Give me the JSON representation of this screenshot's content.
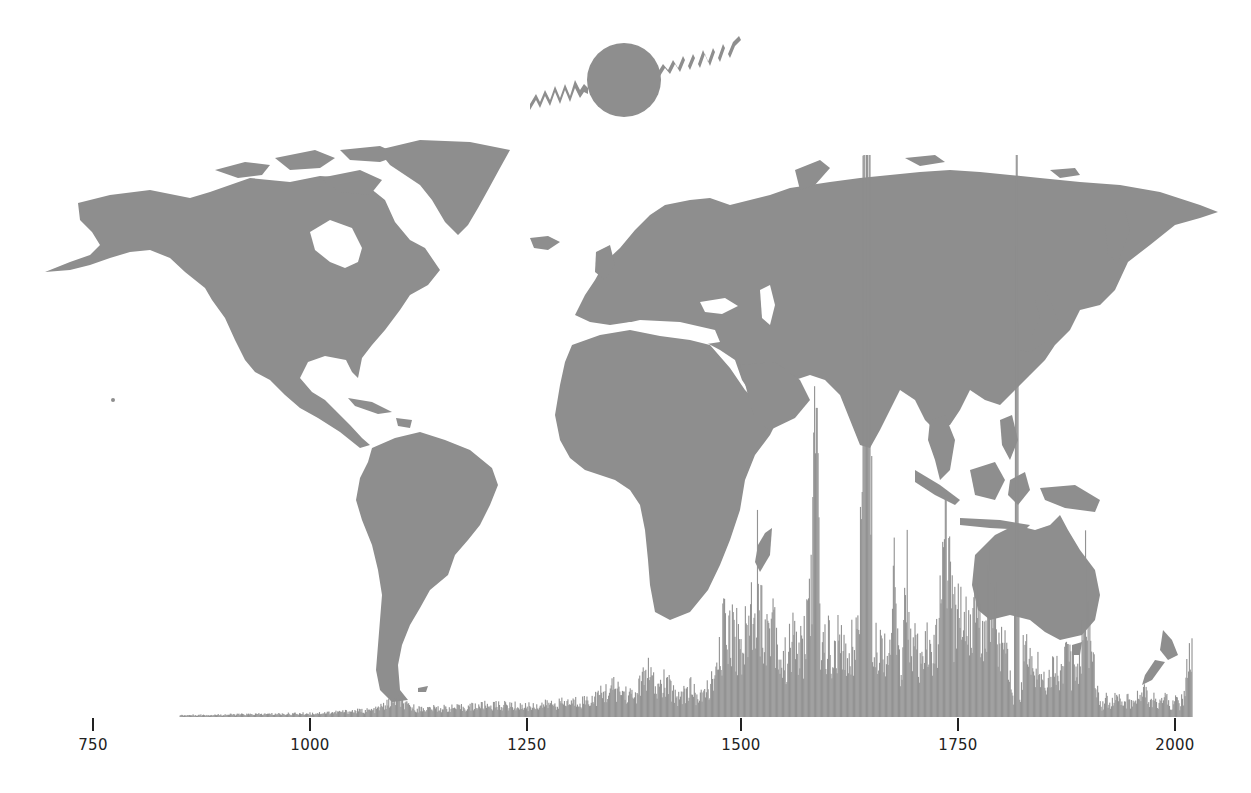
{
  "chart_data": {
    "type": "area",
    "title": "",
    "subtitle": "",
    "xlabel": "",
    "ylabel": "",
    "xlim": [
      750,
      2015
    ],
    "x_ticks": [
      750,
      1000,
      1250,
      1500,
      1750,
      2000
    ],
    "tick_labels": [
      "750",
      "1000",
      "1250",
      "1500",
      "1750",
      "2000"
    ],
    "grid": false,
    "legend": null,
    "series_color": "#8e8e8e",
    "ylim_relative": [
      0,
      1
    ],
    "series": [
      {
        "name": "yearly frequency (relative height, 1 = top of map)",
        "x": [
          850,
          900,
          950,
          1000,
          1025,
          1050,
          1075,
          1100,
          1110,
          1125,
          1150,
          1175,
          1200,
          1225,
          1250,
          1275,
          1300,
          1325,
          1350,
          1375,
          1390,
          1400,
          1410,
          1425,
          1440,
          1450,
          1460,
          1470,
          1475,
          1480,
          1485,
          1490,
          1495,
          1500,
          1505,
          1510,
          1515,
          1518,
          1520,
          1525,
          1530,
          1535,
          1540,
          1545,
          1550,
          1555,
          1560,
          1565,
          1570,
          1575,
          1580,
          1585,
          1588,
          1590,
          1595,
          1600,
          1605,
          1610,
          1615,
          1620,
          1625,
          1630,
          1635,
          1640,
          1643,
          1646,
          1650,
          1655,
          1660,
          1665,
          1670,
          1675,
          1680,
          1685,
          1690,
          1695,
          1700,
          1705,
          1710,
          1715,
          1720,
          1725,
          1730,
          1735,
          1740,
          1745,
          1750,
          1755,
          1760,
          1765,
          1770,
          1775,
          1780,
          1785,
          1790,
          1795,
          1800,
          1805,
          1810,
          1813,
          1816,
          1820,
          1825,
          1830,
          1835,
          1840,
          1845,
          1850,
          1855,
          1860,
          1865,
          1870,
          1875,
          1880,
          1885,
          1890,
          1895,
          1900,
          1905,
          1910,
          1915,
          1920,
          1925,
          1930,
          1935,
          1940,
          1945,
          1950,
          1955,
          1960,
          1965,
          1970,
          1975,
          1980,
          1985,
          1990,
          1995,
          2000,
          2005,
          2010,
          2015
        ],
        "values": [
          0.003,
          0.004,
          0.005,
          0.006,
          0.008,
          0.01,
          0.012,
          0.03,
          0.02,
          0.014,
          0.015,
          0.016,
          0.02,
          0.02,
          0.018,
          0.022,
          0.025,
          0.03,
          0.05,
          0.035,
          0.08,
          0.045,
          0.06,
          0.035,
          0.05,
          0.03,
          0.05,
          0.07,
          0.12,
          0.17,
          0.16,
          0.15,
          0.13,
          0.12,
          0.15,
          0.19,
          0.22,
          0.3,
          0.18,
          0.17,
          0.14,
          0.2,
          0.13,
          0.09,
          0.1,
          0.12,
          0.14,
          0.11,
          0.12,
          0.18,
          0.25,
          0.55,
          0.28,
          0.14,
          0.12,
          0.13,
          0.09,
          0.13,
          0.11,
          0.1,
          0.12,
          0.14,
          0.16,
          1.0,
          1.0,
          1.0,
          0.16,
          0.14,
          0.12,
          0.13,
          0.1,
          0.24,
          0.09,
          0.11,
          0.27,
          0.1,
          0.12,
          0.08,
          0.1,
          0.13,
          0.1,
          0.14,
          0.2,
          0.35,
          0.2,
          0.16,
          0.2,
          0.17,
          0.18,
          0.16,
          0.18,
          0.14,
          0.18,
          0.24,
          0.2,
          0.16,
          0.1,
          0.15,
          0.06,
          0.02,
          1.0,
          0.03,
          0.12,
          0.1,
          0.08,
          0.09,
          0.07,
          0.06,
          0.08,
          0.1,
          0.07,
          0.09,
          0.11,
          0.08,
          0.1,
          0.09,
          0.28,
          0.12,
          0.1,
          0.05,
          0.02,
          0.03,
          0.02,
          0.04,
          0.03,
          0.02,
          0.03,
          0.02,
          0.04,
          0.03,
          0.05,
          0.02,
          0.03,
          0.02,
          0.04,
          0.03,
          0.02,
          0.03,
          0.02,
          0.04,
          0.1
        ]
      }
    ],
    "axis_pixel_mapping": {
      "year_750_x": 93,
      "year_2000_x": 1175,
      "baseline_y": 717,
      "top_y": 155
    }
  },
  "map": {
    "fill": "#8e8e8e",
    "projection": "equirectangular world map",
    "regions": [
      "North America",
      "Greenland",
      "South America",
      "Europe",
      "Africa",
      "Asia",
      "Australia",
      "New Zealand",
      "Madagascar",
      "Indonesia",
      "Japan"
    ]
  },
  "logo": {
    "name": "globe-with-waves-icon",
    "fill": "#8e8e8e"
  },
  "axis": {
    "ticks": [
      {
        "label": "750",
        "x": 93
      },
      {
        "label": "1000",
        "x": 310
      },
      {
        "label": "1250",
        "x": 527
      },
      {
        "label": "1500",
        "x": 741
      },
      {
        "label": "1750",
        "x": 958
      },
      {
        "label": "2000",
        "x": 1175
      }
    ]
  }
}
